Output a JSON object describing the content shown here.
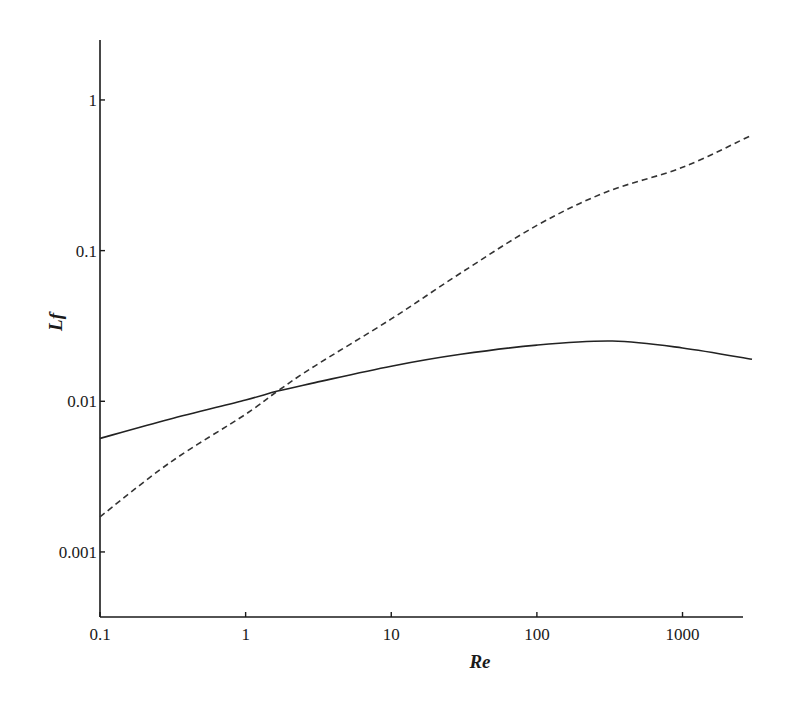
{
  "chart_data": {
    "type": "line",
    "title": "",
    "xlabel": "Re",
    "ylabel": "Lf",
    "xscale": "log",
    "yscale": "log",
    "xlim": [
      0.1,
      3000
    ],
    "ylim": [
      0.00037,
      2.5
    ],
    "grid": false,
    "legend": null,
    "x_ticks": [
      {
        "value": 0.1,
        "label": "0.1"
      },
      {
        "value": 1,
        "label": "1"
      },
      {
        "value": 10,
        "label": "10"
      },
      {
        "value": 100,
        "label": "100"
      },
      {
        "value": 1000,
        "label": "1000"
      }
    ],
    "y_ticks": [
      {
        "value": 0.001,
        "label": "0.001"
      },
      {
        "value": 0.01,
        "label": "0.01"
      },
      {
        "value": 0.1,
        "label": "0.1"
      },
      {
        "value": 1,
        "label": "1"
      }
    ],
    "series": [
      {
        "name": "solid",
        "style": "solid",
        "color": "#222222",
        "x": [
          0.1,
          0.3,
          1,
          1.66,
          3,
          10,
          30,
          100,
          330,
          1000,
          3000
        ],
        "y": [
          0.00567,
          0.0076,
          0.0102,
          0.0117,
          0.0133,
          0.0171,
          0.0205,
          0.0236,
          0.0251,
          0.0226,
          0.019
        ]
      },
      {
        "name": "dashed",
        "style": "dashed",
        "color": "#333333",
        "x": [
          0.1,
          0.3,
          1,
          1.66,
          3,
          10,
          30,
          100,
          300,
          1000,
          3000
        ],
        "y": [
          0.00171,
          0.0039,
          0.0082,
          0.0117,
          0.0172,
          0.0352,
          0.071,
          0.147,
          0.245,
          0.357,
          0.585
        ]
      }
    ]
  }
}
